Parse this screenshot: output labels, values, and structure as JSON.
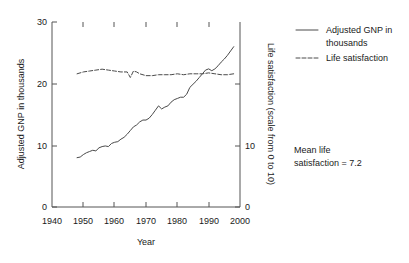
{
  "chart_data": {
    "type": "line",
    "title": "",
    "xlabel": "Year",
    "ylabel": "Adjusted GNP in thousands",
    "y2label": "Life satisfaction (scale from 0 to 10)",
    "xlim": [
      1940,
      2000
    ],
    "ylim": [
      0,
      30
    ],
    "y2lim": [
      0,
      10
    ],
    "xticks": [
      1940,
      1950,
      1960,
      1970,
      1980,
      1990,
      2000
    ],
    "xticklabels": [
      "1940",
      "1950",
      "1960",
      "1970",
      "1980",
      "1990",
      "2000"
    ],
    "yticks": [
      0,
      10,
      20,
      30
    ],
    "yticklabels": [
      "0",
      "10",
      "20",
      "30"
    ],
    "y2ticks": [
      0,
      10
    ],
    "y2ticklabels": [
      "0",
      "10"
    ],
    "grid": false,
    "legend_position": "right",
    "annotations": [
      {
        "text_line_1": "Mean life",
        "text_line_2": "satisfaction = 7.2"
      }
    ],
    "series": [
      {
        "name": "Adjusted GNP in thousands",
        "legend_label_line_1": "Adjusted GNP in",
        "legend_label_line_2": "thousands",
        "style": "solid",
        "color": "#4a4a4a",
        "axis": "left",
        "x": [
          1948,
          1949,
          1950,
          1951,
          1952,
          1953,
          1954,
          1955,
          1956,
          1957,
          1958,
          1959,
          1960,
          1961,
          1962,
          1963,
          1964,
          1965,
          1966,
          1967,
          1968,
          1969,
          1970,
          1971,
          1972,
          1973,
          1974,
          1975,
          1976,
          1977,
          1978,
          1979,
          1980,
          1981,
          1982,
          1983,
          1984,
          1985,
          1986,
          1987,
          1988,
          1989,
          1990,
          1991,
          1992,
          1993,
          1994,
          1995,
          1996,
          1997,
          1998
        ],
        "values": [
          8.0,
          8.1,
          8.5,
          8.8,
          9.0,
          9.2,
          9.1,
          9.6,
          9.8,
          9.9,
          9.8,
          10.3,
          10.5,
          10.6,
          11.0,
          11.3,
          11.8,
          12.4,
          13.0,
          13.3,
          13.8,
          14.1,
          14.1,
          14.4,
          15.0,
          15.7,
          16.4,
          15.9,
          16.2,
          16.4,
          17.0,
          17.4,
          17.6,
          17.8,
          17.8,
          18.3,
          19.4,
          19.9,
          20.4,
          21.0,
          21.6,
          22.2,
          22.4,
          22.1,
          22.4,
          22.9,
          23.5,
          24.0,
          24.6,
          25.3,
          26.0
        ]
      },
      {
        "name": "Life satisfaction",
        "legend_label_line_1": "Life satisfaction",
        "legend_label_line_2": "",
        "style": "dashed",
        "color": "#4a4a4a",
        "axis": "right",
        "x": [
          1948,
          1950,
          1952,
          1954,
          1956,
          1958,
          1960,
          1962,
          1964,
          1965,
          1966,
          1967,
          1968,
          1970,
          1972,
          1974,
          1976,
          1978,
          1980,
          1982,
          1984,
          1986,
          1988,
          1990,
          1992,
          1994,
          1996,
          1998
        ],
        "values": [
          7.2,
          7.3,
          7.35,
          7.4,
          7.45,
          7.4,
          7.35,
          7.3,
          7.3,
          7.0,
          7.35,
          7.3,
          7.2,
          7.1,
          7.1,
          7.15,
          7.15,
          7.15,
          7.2,
          7.15,
          7.2,
          7.2,
          7.2,
          7.25,
          7.2,
          7.15,
          7.15,
          7.2
        ]
      }
    ]
  }
}
